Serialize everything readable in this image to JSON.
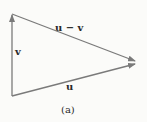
{
  "diagram": {
    "labels": {
      "u_minus_v": "u − v",
      "v": "v",
      "u": "u",
      "caption": "(a)"
    },
    "colors": {
      "stroke": "#7a7a7a",
      "text": "#2a2a2a",
      "background": "#fbfbf9"
    }
  }
}
